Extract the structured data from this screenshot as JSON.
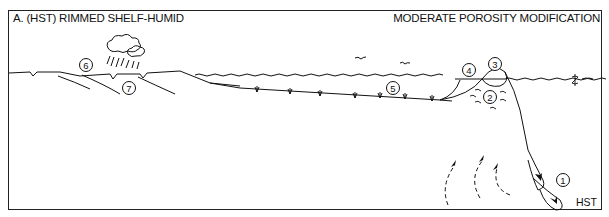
{
  "diagram": {
    "title": "A.  (HST) RIMMED SHELF-HUMID",
    "subtitle": "MODERATE  POROSITY MODIFICATION",
    "systems_tract_label": "HST",
    "sea_level_symbol": "sea-level-marker",
    "callouts": [
      {
        "id": "1",
        "label": "1",
        "location": "slope gravity-flow lobes"
      },
      {
        "id": "2",
        "label": "2",
        "location": "below reef margin"
      },
      {
        "id": "3",
        "label": "3",
        "location": "reef crest"
      },
      {
        "id": "4",
        "label": "4",
        "location": "back-reef"
      },
      {
        "id": "5",
        "label": "5",
        "location": "shelf lagoon"
      },
      {
        "id": "6",
        "label": "6",
        "location": "coastal land surface"
      },
      {
        "id": "7",
        "label": "7",
        "location": "subaerial beds"
      }
    ],
    "elements": [
      "rain-cloud",
      "birds",
      "sea-surface-waves",
      "seagrass-tufts",
      "upwelling-arrows",
      "downslope-arrows"
    ]
  }
}
